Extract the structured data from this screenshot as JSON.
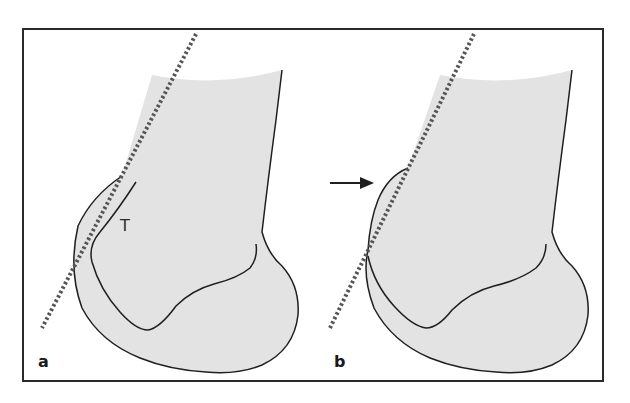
{
  "figure": {
    "panels": [
      {
        "id": "a",
        "label": "a",
        "annotation": "T"
      },
      {
        "id": "b",
        "label": "b",
        "annotation": ""
      }
    ],
    "colors": {
      "bone_fill": "#e3e3e3",
      "outline": "#1f1f1f",
      "dotted_line": "#555555",
      "frame": "#2a2a2a"
    }
  }
}
